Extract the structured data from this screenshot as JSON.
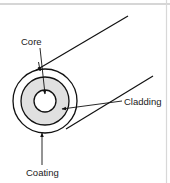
{
  "figure": {
    "background_color": "#ffffff",
    "frame": {
      "top_rule_color": "#c8c8c8",
      "right_rule_color": "#d2d2d2"
    },
    "labels": {
      "core": "Core",
      "cladding": "Cladding",
      "coating": "Coating"
    },
    "regions": {
      "coating": {
        "name": "Coating",
        "fill": "#ffffff",
        "stroke": "#111111"
      },
      "cladding": {
        "name": "Cladding",
        "fill": "#e0e0e0",
        "stroke": "#111111"
      },
      "core": {
        "name": "Core",
        "fill": "#ffffff",
        "stroke": "#111111"
      }
    },
    "geometry": {
      "center_x": 45,
      "center_y": 101,
      "radius_coating_outer": 32,
      "radius_cladding_outer": 24,
      "radius_core": 11
    },
    "body_lines": [
      {
        "name": "upper-edge-line",
        "x1": 33,
        "y1": 72,
        "x2": 128,
        "y2": 16
      },
      {
        "name": "lower-edge-line",
        "x1": 66,
        "y1": 129,
        "x2": 153,
        "y2": 76
      }
    ],
    "leaders": [
      {
        "name": "core-leader",
        "label": "Core",
        "x1": 40,
        "y1": 48,
        "x2": 45,
        "y2": 94
      },
      {
        "name": "cladding-leader",
        "label": "Cladding",
        "x1": 122,
        "y1": 101,
        "x2": 62,
        "y2": 109
      },
      {
        "name": "coating-leader",
        "label": "Coating",
        "x1": 42,
        "y1": 165,
        "x2": 42,
        "y2": 133
      }
    ]
  }
}
